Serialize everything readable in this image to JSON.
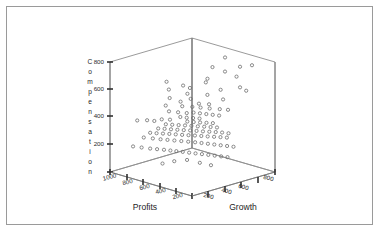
{
  "figure": {
    "border_color": "#9a9a9a",
    "background": "#ffffff",
    "frame_line_color": "#8e8e8e"
  },
  "chart_data": {
    "type": "scatter",
    "projection": "3d",
    "title": "",
    "xlabel": "Profits",
    "ylabel": "Growth",
    "zlabel": "Compensation",
    "zlabel_chars": [
      "C",
      "o",
      "m",
      "p",
      "e",
      "n",
      "s",
      "a",
      "t",
      "i",
      "o",
      "n"
    ],
    "grid": false,
    "legend": null,
    "marker": "open-circle",
    "marker_color": "#6d6d6d",
    "xticks": [
      1000,
      800,
      600,
      400,
      200
    ],
    "xtick_labels": [
      "1000",
      "800",
      "600",
      "400",
      "200"
    ],
    "yticks": [
      200,
      400,
      600,
      800
    ],
    "ytick_labels": [
      "200",
      "400",
      "600",
      "800"
    ],
    "zticks": [
      200,
      400,
      600,
      800
    ],
    "ztick_labels": [
      "200",
      "400",
      "600",
      "800"
    ],
    "xlim": [
      0,
      1000
    ],
    "ylim": [
      0,
      800
    ],
    "zlim": [
      0,
      800
    ],
    "x_axis_direction": "descending-left-to-right",
    "y_axis_direction": "ascending-left-to-right",
    "n_points": 118,
    "points": [
      [
        690,
        300,
        645
      ],
      [
        470,
        690,
        775
      ],
      [
        300,
        700,
        735
      ],
      [
        560,
        640,
        700
      ],
      [
        230,
        760,
        745
      ],
      [
        420,
        650,
        690
      ],
      [
        330,
        690,
        660
      ],
      [
        520,
        560,
        640
      ],
      [
        640,
        420,
        600
      ],
      [
        540,
        560,
        610
      ],
      [
        700,
        330,
        580
      ],
      [
        620,
        470,
        575
      ],
      [
        410,
        600,
        570
      ],
      [
        300,
        700,
        585
      ],
      [
        250,
        720,
        565
      ],
      [
        600,
        430,
        545
      ],
      [
        470,
        520,
        540
      ],
      [
        690,
        330,
        520
      ],
      [
        560,
        430,
        515
      ],
      [
        380,
        600,
        505
      ],
      [
        620,
        380,
        495
      ],
      [
        510,
        470,
        480
      ],
      [
        450,
        520,
        475
      ],
      [
        700,
        300,
        470
      ],
      [
        600,
        380,
        465
      ],
      [
        540,
        430,
        460
      ],
      [
        490,
        470,
        455
      ],
      [
        430,
        510,
        450
      ],
      [
        370,
        560,
        445
      ],
      [
        320,
        600,
        440
      ],
      [
        660,
        300,
        435
      ],
      [
        600,
        340,
        430
      ],
      [
        545,
        380,
        425
      ],
      [
        500,
        410,
        430
      ],
      [
        460,
        440,
        425
      ],
      [
        420,
        470,
        420
      ],
      [
        380,
        500,
        415
      ],
      [
        340,
        530,
        410
      ],
      [
        560,
        330,
        405
      ],
      [
        520,
        360,
        400
      ],
      [
        480,
        390,
        398
      ],
      [
        440,
        420,
        395
      ],
      [
        660,
        230,
        392
      ],
      [
        610,
        270,
        390
      ],
      [
        750,
        160,
        385
      ],
      [
        700,
        190,
        382
      ],
      [
        820,
        120,
        380
      ],
      [
        500,
        350,
        378
      ],
      [
        460,
        380,
        375
      ],
      [
        420,
        410,
        372
      ],
      [
        380,
        440,
        370
      ],
      [
        340,
        470,
        368
      ],
      [
        610,
        230,
        365
      ],
      [
        570,
        260,
        362
      ],
      [
        530,
        290,
        360
      ],
      [
        490,
        320,
        358
      ],
      [
        450,
        350,
        355
      ],
      [
        410,
        380,
        352
      ],
      [
        370,
        410,
        350
      ],
      [
        330,
        440,
        348
      ],
      [
        290,
        470,
        345
      ],
      [
        640,
        180,
        340
      ],
      [
        600,
        210,
        338
      ],
      [
        560,
        240,
        335
      ],
      [
        520,
        270,
        332
      ],
      [
        480,
        300,
        330
      ],
      [
        440,
        330,
        328
      ],
      [
        400,
        360,
        325
      ],
      [
        360,
        390,
        322
      ],
      [
        320,
        420,
        320
      ],
      [
        280,
        450,
        318
      ],
      [
        240,
        480,
        315
      ],
      [
        200,
        510,
        310
      ],
      [
        700,
        150,
        305
      ],
      [
        660,
        180,
        302
      ],
      [
        620,
        210,
        300
      ],
      [
        580,
        240,
        298
      ],
      [
        540,
        270,
        295
      ],
      [
        500,
        300,
        292
      ],
      [
        460,
        330,
        290
      ],
      [
        420,
        360,
        288
      ],
      [
        380,
        390,
        285
      ],
      [
        340,
        420,
        282
      ],
      [
        300,
        450,
        280
      ],
      [
        260,
        480,
        278
      ],
      [
        220,
        510,
        275
      ],
      [
        740,
        120,
        270
      ],
      [
        680,
        160,
        265
      ],
      [
        630,
        195,
        260
      ],
      [
        590,
        230,
        255
      ],
      [
        550,
        265,
        250
      ],
      [
        510,
        300,
        245
      ],
      [
        470,
        335,
        240
      ],
      [
        430,
        370,
        235
      ],
      [
        390,
        400,
        230
      ],
      [
        350,
        430,
        225
      ],
      [
        310,
        460,
        220
      ],
      [
        270,
        490,
        215
      ],
      [
        230,
        520,
        210
      ],
      [
        190,
        550,
        205
      ],
      [
        820,
        80,
        200
      ],
      [
        760,
        115,
        195
      ],
      [
        700,
        150,
        190
      ],
      [
        660,
        185,
        185
      ],
      [
        620,
        220,
        180
      ],
      [
        580,
        250,
        175
      ],
      [
        545,
        280,
        170
      ],
      [
        505,
        310,
        165
      ],
      [
        465,
        340,
        160
      ],
      [
        425,
        370,
        155
      ],
      [
        385,
        400,
        150
      ],
      [
        345,
        430,
        145
      ],
      [
        305,
        460,
        140
      ],
      [
        265,
        490,
        135
      ],
      [
        225,
        520,
        130
      ],
      [
        440,
        300,
        120
      ],
      [
        520,
        240,
        110
      ],
      [
        360,
        360,
        100
      ],
      [
        600,
        190,
        90
      ],
      [
        300,
        420,
        80
      ]
    ]
  }
}
